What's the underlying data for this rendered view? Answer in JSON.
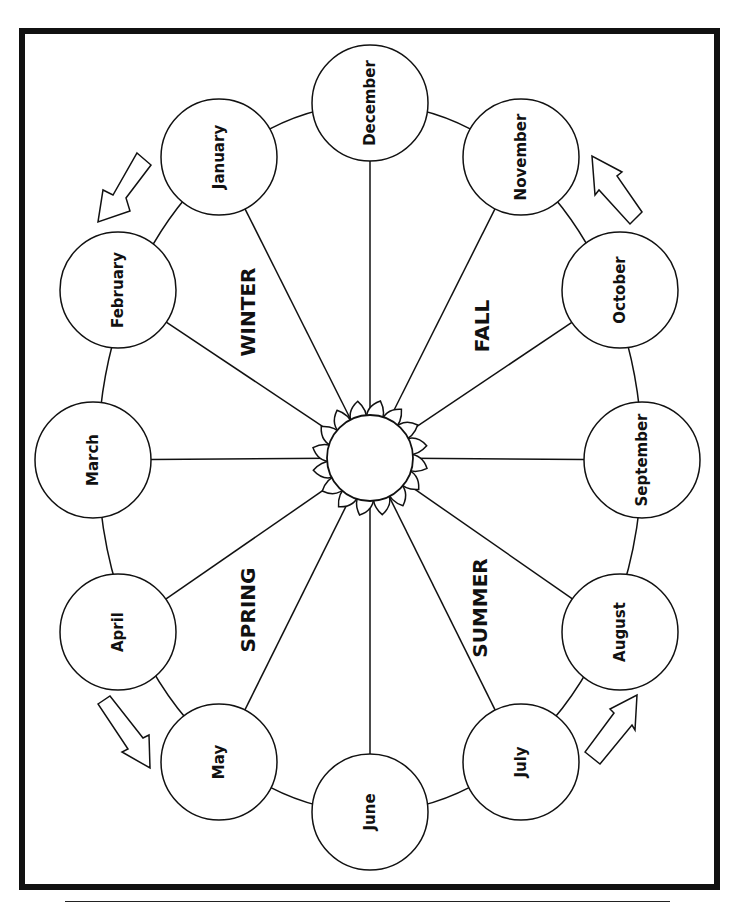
{
  "diagram": {
    "center": {
      "x": 370,
      "y": 458,
      "label": "sun"
    },
    "ring": {
      "rx": 272,
      "ry": 354
    },
    "months": [
      {
        "label": "December",
        "x": 370,
        "y": 103
      },
      {
        "label": "January",
        "x": 219,
        "y": 157
      },
      {
        "label": "February",
        "x": 118,
        "y": 290
      },
      {
        "label": "March",
        "x": 93,
        "y": 460
      },
      {
        "label": "April",
        "x": 118,
        "y": 632
      },
      {
        "label": "May",
        "x": 219,
        "y": 762
      },
      {
        "label": "June",
        "x": 370,
        "y": 812
      },
      {
        "label": "July",
        "x": 521,
        "y": 762
      },
      {
        "label": "August",
        "x": 620,
        "y": 632
      },
      {
        "label": "September",
        "x": 642,
        "y": 460
      },
      {
        "label": "October",
        "x": 620,
        "y": 290
      },
      {
        "label": "November",
        "x": 521,
        "y": 157
      }
    ],
    "seasons": [
      {
        "label": "WINTER",
        "x": 248,
        "y": 312
      },
      {
        "label": "SPRING",
        "x": 248,
        "y": 610
      },
      {
        "label": "SUMMER",
        "x": 480,
        "y": 608
      },
      {
        "label": "FALL",
        "x": 482,
        "y": 326
      }
    ],
    "arrows": [
      {
        "name": "arrow-jan-feb",
        "direction": "down-left"
      },
      {
        "name": "arrow-apr-may",
        "direction": "down-right"
      },
      {
        "name": "arrow-jul-aug",
        "direction": "up-right"
      },
      {
        "name": "arrow-oct-nov",
        "direction": "up-left"
      }
    ],
    "colors": {
      "stroke": "#111111",
      "background": "#ffffff"
    }
  }
}
